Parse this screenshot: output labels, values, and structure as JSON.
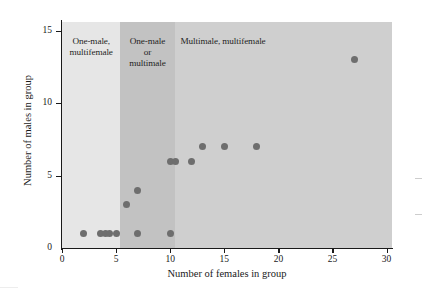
{
  "chart_data": {
    "type": "scatter",
    "title": "",
    "xlabel": "Number of females in group",
    "ylabel": "Number of males in group",
    "xlim": [
      0,
      30.5
    ],
    "ylim": [
      0,
      15.6
    ],
    "xticks": [
      0,
      5,
      10,
      15,
      20,
      25,
      30
    ],
    "yticks": [
      0,
      5,
      10,
      15
    ],
    "grid": false,
    "legend": "none",
    "point_color": "#6e6e6e",
    "points": [
      {
        "x": 2,
        "y": 1
      },
      {
        "x": 3.6,
        "y": 1
      },
      {
        "x": 4,
        "y": 1
      },
      {
        "x": 4.4,
        "y": 1
      },
      {
        "x": 5,
        "y": 1
      },
      {
        "x": 6,
        "y": 3
      },
      {
        "x": 7,
        "y": 4
      },
      {
        "x": 7,
        "y": 1
      },
      {
        "x": 10,
        "y": 1
      },
      {
        "x": 10,
        "y": 6
      },
      {
        "x": 10.5,
        "y": 6
      },
      {
        "x": 12,
        "y": 6
      },
      {
        "x": 13,
        "y": 7
      },
      {
        "x": 15,
        "y": 7
      },
      {
        "x": 18,
        "y": 7
      },
      {
        "x": 27,
        "y": 13
      }
    ],
    "bands": [
      {
        "name": "one-male-multifemale",
        "label": "One-male,\nmultifemale",
        "x_start": 0,
        "x_end": 5.4,
        "color": "#e6e6e6",
        "label_align": "center"
      },
      {
        "name": "one-male-or-multimale",
        "label": "One-male\nor\nmultimale",
        "x_start": 5.4,
        "x_end": 10.4,
        "color": "#c2c2c2",
        "label_align": "center"
      },
      {
        "name": "multimale-multifemale",
        "label": "Multimale, multifemale",
        "x_start": 10.4,
        "x_end": 30.5,
        "color": "#cfcfcf",
        "label_align": "left"
      }
    ]
  }
}
